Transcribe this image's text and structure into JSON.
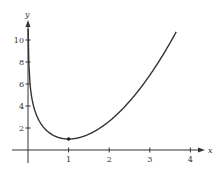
{
  "chart_data": {
    "type": "line",
    "title": "",
    "xlabel": "x",
    "ylabel": "y",
    "xlim": [
      0,
      4.2
    ],
    "ylim": [
      0,
      11
    ],
    "x_ticks": [
      1,
      2,
      3,
      4
    ],
    "y_ticks": [
      2,
      4,
      6,
      8,
      10
    ],
    "grid": false,
    "legend": null,
    "series": [
      {
        "name": "curve",
        "description": "Convex curve descending steeply from near the y-axis to a minimum at (1, 1), then rising to about (3.65, 10.8)",
        "x": [
          0.05,
          0.1,
          0.2,
          0.3,
          0.5,
          0.75,
          1.0,
          1.5,
          2.0,
          2.5,
          3.0,
          3.5,
          3.65
        ],
        "y": [
          6.0,
          4.6,
          3.26,
          2.5,
          1.64,
          1.14,
          1.0,
          1.44,
          2.61,
          4.42,
          6.8,
          9.74,
          10.73
        ]
      }
    ],
    "annotations": [
      {
        "type": "point",
        "x": 1,
        "y": 1,
        "label": "minimum"
      }
    ]
  },
  "labels": {
    "x_axis": "x",
    "y_axis": "y",
    "x_ticks": [
      "1",
      "2",
      "3",
      "4"
    ],
    "y_ticks": [
      "2",
      "4",
      "6",
      "8",
      "10"
    ]
  }
}
